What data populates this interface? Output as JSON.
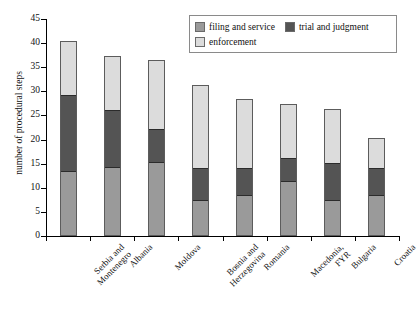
{
  "chart_data": {
    "type": "bar",
    "stacked": true,
    "title": "",
    "xlabel": "",
    "ylabel": "number of procedural steps",
    "ylim": [
      0,
      45
    ],
    "yticks": [
      0,
      5,
      10,
      15,
      20,
      25,
      30,
      35,
      40,
      45
    ],
    "grid": false,
    "legend_position": "top-right",
    "categories": [
      "Serbia and Montenegro",
      "Albania",
      "Moldova",
      "Bosnia and Herzegovina",
      "Romania",
      "Macedonia, FYR",
      "Bulgaria",
      "Croatia"
    ],
    "series": [
      {
        "name": "filing and service",
        "color": "#9a9a9a",
        "values": [
          13,
          14,
          15,
          7,
          8,
          11,
          7,
          8
        ]
      },
      {
        "name": "trial and judgment",
        "color": "#545454",
        "values": [
          16,
          12,
          7,
          7,
          6,
          5,
          8,
          6
        ]
      },
      {
        "name": "enforcement",
        "color": "#dcdcdc",
        "values": [
          11,
          11,
          14,
          17,
          14,
          11,
          11,
          6
        ]
      }
    ],
    "totals": [
      40,
      37,
      36,
      31,
      28,
      27,
      26,
      20
    ]
  },
  "legend": {
    "entries": [
      {
        "label": "filing and service",
        "swatch": "sw-filing"
      },
      {
        "label": "trial and judgment",
        "swatch": "sw-trial"
      },
      {
        "label": "enforcement",
        "swatch": "sw-enforcement"
      }
    ]
  },
  "caption": {
    "text": ""
  }
}
